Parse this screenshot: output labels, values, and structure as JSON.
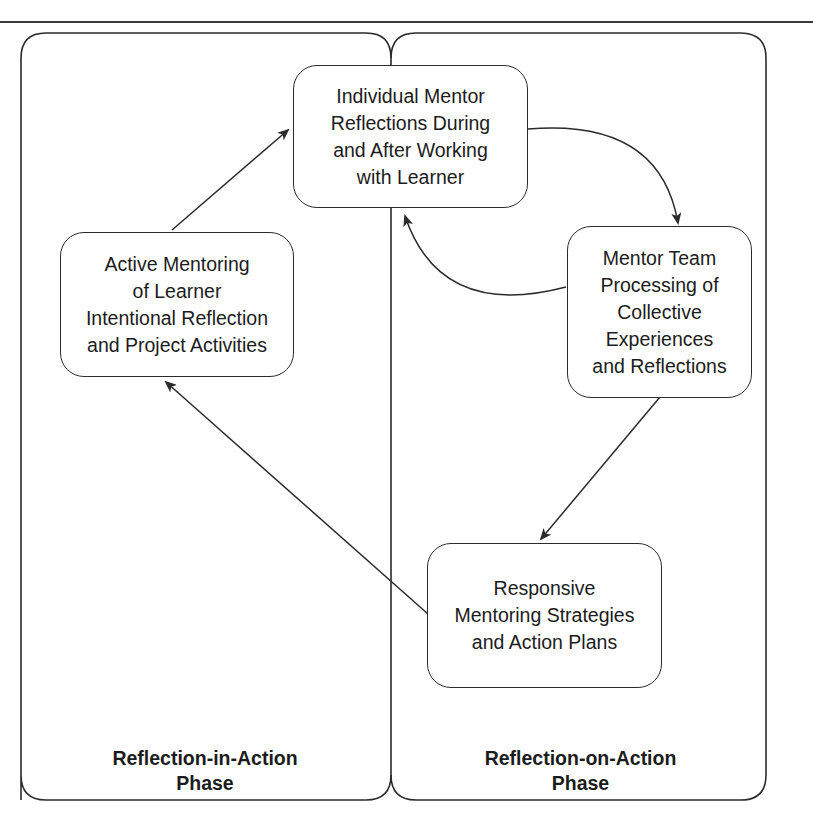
{
  "diagram": {
    "type": "reflective-mentoring-cycle",
    "phases": [
      {
        "id": "in-action",
        "label": "Reflection-in-Action\nPhase"
      },
      {
        "id": "on-action",
        "label": "Reflection-on-Action\nPhase"
      }
    ],
    "nodes": [
      {
        "id": "individual",
        "phase": "on-action",
        "label": "Individual Mentor\nReflections During\nand After Working\nwith Learner"
      },
      {
        "id": "active",
        "phase": "in-action",
        "label": "Active Mentoring\nof Learner\nIntentional Reflection\nand Project Activities"
      },
      {
        "id": "team",
        "phase": "on-action",
        "label": "Mentor Team\nProcessing of\nCollective\nExperiences\nand Reflections"
      },
      {
        "id": "responsive",
        "phase": "on-action",
        "label": "Responsive\nMentoring Strategies\nand Action Plans"
      }
    ],
    "edges": [
      {
        "from": "active",
        "to": "individual",
        "style": "straight"
      },
      {
        "from": "individual",
        "to": "team",
        "style": "curved"
      },
      {
        "from": "team",
        "to": "individual",
        "style": "curved"
      },
      {
        "from": "team",
        "to": "responsive",
        "style": "straight"
      },
      {
        "from": "responsive",
        "to": "active",
        "style": "straight"
      }
    ],
    "colors": {
      "stroke": "#2b2b2b",
      "background": "#ffffff",
      "text": "#1c1c1c"
    }
  }
}
